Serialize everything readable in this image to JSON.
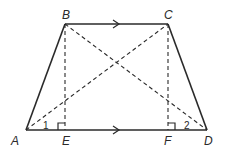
{
  "diagram": {
    "type": "trapezoid",
    "points": {
      "A": {
        "label": "A",
        "x": 26,
        "y": 130
      },
      "B": {
        "label": "B",
        "x": 65,
        "y": 24
      },
      "C": {
        "label": "C",
        "x": 168,
        "y": 24
      },
      "D": {
        "label": "D",
        "x": 207,
        "y": 130
      },
      "E": {
        "label": "E",
        "x": 65,
        "y": 130
      },
      "F": {
        "label": "F",
        "x": 168,
        "y": 130
      }
    },
    "angles": {
      "angle1": {
        "label": "1",
        "at": "A"
      },
      "angle2": {
        "label": "2",
        "at": "D"
      }
    },
    "solid_segments": [
      "AB",
      "BC",
      "CD",
      "AD"
    ],
    "dashed_segments": [
      "AC",
      "BD",
      "BE",
      "CF"
    ],
    "parallel_marks": [
      "BC",
      "AD"
    ],
    "right_angles": [
      "E",
      "F"
    ],
    "colors": {
      "line": "#2a2a2a",
      "background": "#ffffff"
    }
  }
}
